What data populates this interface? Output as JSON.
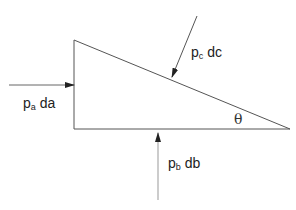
{
  "diagram": {
    "type": "free-body wedge element with pressure forces",
    "shape": {
      "name": "right-triangle-element",
      "vertices": [
        [
          74,
          40
        ],
        [
          74,
          129
        ],
        [
          290,
          129
        ]
      ],
      "stroke": "#555555"
    },
    "forces": [
      {
        "id": "a",
        "symbol": "p",
        "subscript": "a",
        "differential": "da",
        "direction": "right",
        "on_face": "vertical-left-face"
      },
      {
        "id": "c",
        "symbol": "p",
        "subscript": "c",
        "differential": "dc",
        "direction": "down-left",
        "on_face": "hypotenuse"
      },
      {
        "id": "b",
        "symbol": "p",
        "subscript": "b",
        "differential": "db",
        "direction": "up",
        "on_face": "bottom-face"
      }
    ],
    "angle_label": "θ",
    "colors": {
      "line": "#555555",
      "arrow_bottom": "#aaaaaa",
      "text": "#222222"
    }
  },
  "labels": {
    "force_a": {
      "main": "p",
      "sub": "a",
      "tail": " da"
    },
    "force_c": {
      "main": "p",
      "sub": "c",
      "tail": " dc"
    },
    "force_b": {
      "main": "p",
      "sub": "b",
      "tail": " db"
    },
    "theta": "θ"
  }
}
